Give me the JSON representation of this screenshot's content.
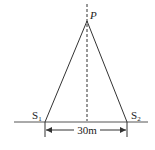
{
  "diagram": {
    "apex_label": "P",
    "source1_label": "S",
    "source1_sub": "1",
    "source2_label": "S",
    "source2_sub": "2",
    "distance_label": "30m",
    "line_color": "#333333"
  }
}
